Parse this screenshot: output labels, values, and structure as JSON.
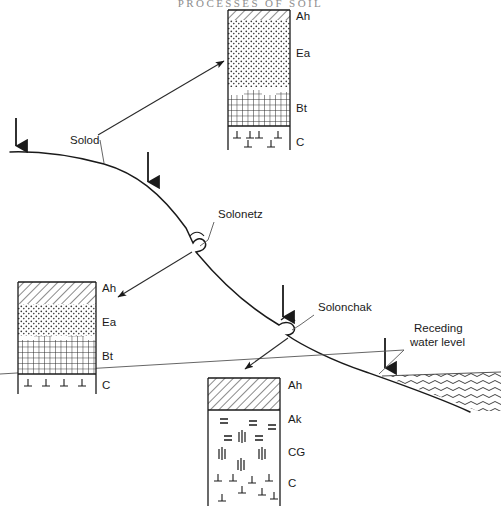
{
  "page": {
    "running_header": "PROCESSES OF SOIL"
  },
  "diagram": {
    "type": "landscape-cross-section",
    "terrain_labels": [
      {
        "id": "solod",
        "text": "Solod",
        "x": 70,
        "y": 144
      },
      {
        "id": "solonetz",
        "text": "Solonetz",
        "x": 218,
        "y": 218
      },
      {
        "id": "solonchak",
        "text": "Solonchak",
        "x": 318,
        "y": 311
      }
    ],
    "water": {
      "label_line1": "Receding",
      "label_line2": "water level",
      "label_x": 414,
      "label_y": 332
    },
    "infiltration_arrows": [
      {
        "id": "arrow-1",
        "x": 16,
        "y_top": 118,
        "y_bottom": 152
      },
      {
        "id": "arrow-2",
        "x": 148,
        "y_top": 152,
        "y_bottom": 190
      },
      {
        "id": "arrow-3",
        "x": 283,
        "y_top": 285,
        "y_bottom": 325
      },
      {
        "id": "arrow-4",
        "x": 385,
        "y_top": 338,
        "y_bottom": 375
      }
    ],
    "profiles": [
      {
        "id": "solod-profile-upper",
        "name": "Solod profile (upper slope)",
        "x": 228,
        "y": 10,
        "width": 62,
        "height": 140,
        "horizons": [
          {
            "label": "Ah",
            "pattern": "hatch",
            "depth_pct": 7
          },
          {
            "label": "Ea",
            "pattern": "stipple",
            "depth_pct": 48
          },
          {
            "label": "Bt",
            "pattern": "grid",
            "depth_pct": 28
          },
          {
            "label": "C",
            "pattern": "tees",
            "depth_pct": 17
          }
        ]
      },
      {
        "id": "solonetz-profile-left",
        "name": "Solonetz profile (mid slope)",
        "x": 18,
        "y": 282,
        "width": 78,
        "height": 108,
        "horizons": [
          {
            "label": "Ah",
            "pattern": "hatch",
            "depth_pct": 20
          },
          {
            "label": "Ea",
            "pattern": "stipple",
            "depth_pct": 30
          },
          {
            "label": "Bt",
            "pattern": "grid",
            "depth_pct": 35
          },
          {
            "label": "C",
            "pattern": "tees",
            "depth_pct": 15
          }
        ]
      },
      {
        "id": "solonchak-profile-lower",
        "name": "Solonchak profile (lower slope)",
        "x": 208,
        "y": 378,
        "width": 72,
        "height": 128,
        "horizons": [
          {
            "label": "Ah",
            "pattern": "hatch",
            "depth_pct": 25
          },
          {
            "label": "Ak",
            "pattern": "equals",
            "depth_pct": 22
          },
          {
            "label": "CG",
            "pattern": "bars",
            "depth_pct": 27
          },
          {
            "label": "C",
            "pattern": "tees",
            "depth_pct": 26
          }
        ]
      }
    ],
    "horizon_legend": {
      "Ah": "Humose surface horizon",
      "Ea": "Eluvial (bleached) horizon",
      "Bt": "Clay-enriched illuvial horizon",
      "Ak": "Carbonate accumulation horizon",
      "CG": "Gleyed parent material",
      "C": "Parent material"
    },
    "colors": {
      "line": "#1a1a1a",
      "background": "#ffffff",
      "header_text": "#8d8d8d"
    }
  }
}
